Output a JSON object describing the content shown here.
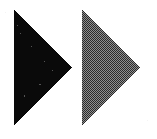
{
  "figure": {
    "canvas": {
      "width": 157,
      "height": 139,
      "background_color": "#ffffff"
    },
    "shapes": [
      {
        "name": "solid-black-triangle",
        "role": "left",
        "label": "Solid fill triangle",
        "direction": "right-pointing",
        "fill_style": "solid",
        "fill_color": "#0a0a0a",
        "points": "14,10 14,126 72,67",
        "vertices": [
          {
            "x": 14,
            "y": 10
          },
          {
            "x": 14,
            "y": 126
          },
          {
            "x": 72,
            "y": 67
          }
        ]
      },
      {
        "name": "dithered-gray-triangle",
        "role": "right",
        "label": "Checkerboard dither fill triangle",
        "direction": "right-pointing",
        "fill_style": "checkerboard-dither-50",
        "fill_color_dark": "#2b2b2b",
        "fill_color_light": "#8f8f8f",
        "dither_cell_px": 1,
        "points": "82,10 82,126 140,67",
        "vertices": [
          {
            "x": 82,
            "y": 10
          },
          {
            "x": 82,
            "y": 126
          },
          {
            "x": 140,
            "y": 67
          }
        ]
      }
    ]
  }
}
